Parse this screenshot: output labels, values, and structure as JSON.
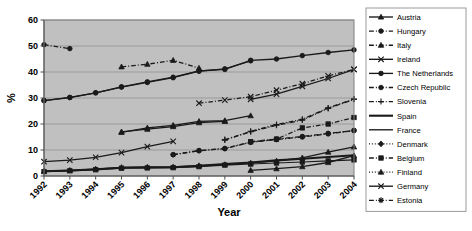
{
  "chart_data": {
    "type": "line",
    "title": "",
    "xlabel": "Year",
    "ylabel": "%",
    "x": [
      1992,
      1993,
      1994,
      1995,
      1996,
      1997,
      1998,
      1999,
      2000,
      2001,
      2002,
      2003,
      2004
    ],
    "xtick_labels": [
      "1992",
      "1993",
      "1994",
      "1995",
      "1996",
      "1997",
      "1998",
      "1999",
      "2000",
      "2001",
      "2002",
      "2003",
      "2004"
    ],
    "ytick_labels": [
      "0",
      "10",
      "20",
      "30",
      "40",
      "50",
      "60"
    ],
    "yticks": [
      0,
      10,
      20,
      30,
      40,
      50,
      60
    ],
    "ylim": [
      0,
      60
    ],
    "grid": "horizontal",
    "legend_position": "right",
    "plot_background": "#c0c0c0",
    "line_color": "#1a1a1a",
    "series": [
      {
        "name": "Austria",
        "marker": "triangle",
        "dash": "solid",
        "values": [
          null,
          null,
          null,
          null,
          null,
          null,
          null,
          null,
          2.2,
          2.8,
          3.6,
          5.2,
          7.8
        ]
      },
      {
        "name": "Hungary",
        "marker": "circle",
        "dash": "dashdot",
        "values": [
          50.5,
          49.0,
          null,
          null,
          null,
          null,
          null,
          null,
          null,
          null,
          null,
          null,
          null
        ]
      },
      {
        "name": "Italy",
        "marker": "triangle",
        "dash": "dashdot",
        "values": [
          null,
          null,
          null,
          42.0,
          43.0,
          44.5,
          41.5,
          null,
          null,
          null,
          null,
          null,
          null
        ]
      },
      {
        "name": "Ireland",
        "marker": "x",
        "dash": "solid",
        "values": [
          5.5,
          6.1,
          7.2,
          9.0,
          11.3,
          13.3,
          null,
          null,
          null,
          null,
          null,
          null,
          null
        ]
      },
      {
        "name": "The Netherlands",
        "marker": "circle",
        "dash": "solid",
        "values": [
          29.0,
          30.2,
          32.0,
          34.3,
          36.2,
          38.0,
          40.4,
          41.0,
          44.5,
          45.0,
          46.3,
          47.5,
          48.5
        ]
      },
      {
        "name": "Czech Republic",
        "marker": "circle",
        "dash": "dashdot",
        "values": [
          null,
          null,
          null,
          null,
          null,
          8.2,
          9.7,
          10.6,
          13.0,
          14.0,
          15.0,
          16.2,
          17.5
        ]
      },
      {
        "name": "Slovenia",
        "marker": "plus",
        "dash": "dashdot",
        "values": [
          null,
          null,
          null,
          null,
          null,
          null,
          null,
          14.0,
          17.0,
          19.5,
          21.5,
          26.0,
          29.5
        ]
      },
      {
        "name": "Spain",
        "marker": "none",
        "dash": "solid",
        "values": [
          1.8,
          2.1,
          2.6,
          3.2,
          3.3,
          3.4,
          3.9,
          4.6,
          5.2,
          6.0,
          6.6,
          7.3,
          8.0
        ]
      },
      {
        "name": "France",
        "marker": "none",
        "dash": "solid",
        "values": [
          null,
          null,
          null,
          null,
          null,
          null,
          null,
          null,
          null,
          null,
          null,
          null,
          null
        ]
      },
      {
        "name": "Denmark",
        "marker": "diamond",
        "dash": "dotted",
        "values": [
          null,
          null,
          null,
          null,
          null,
          null,
          null,
          null,
          null,
          null,
          null,
          null,
          null
        ]
      },
      {
        "name": "Belgium",
        "marker": "square",
        "dash": "dashdot",
        "values": [
          null,
          null,
          null,
          null,
          null,
          null,
          null,
          null,
          13.2,
          14.2,
          18.5,
          20.0,
          22.5
        ]
      },
      {
        "name": "Finland",
        "marker": "triangle",
        "dash": "dotted",
        "values": [
          null,
          null,
          null,
          null,
          null,
          null,
          null,
          null,
          null,
          null,
          null,
          null,
          null
        ]
      },
      {
        "name": "Germany",
        "marker": "x",
        "dash": "solid",
        "values": [
          null,
          null,
          null,
          null,
          null,
          null,
          null,
          null,
          29.5,
          31.5,
          34.5,
          37.5,
          41.0
        ]
      },
      {
        "name": "Estonia",
        "marker": "star",
        "dash": "dashdot",
        "values": [
          null,
          null,
          null,
          null,
          null,
          null,
          null,
          null,
          null,
          null,
          null,
          null,
          null
        ]
      }
    ],
    "extra_paths": [
      {
        "name": "Austria-early",
        "marker": "triangle",
        "dash": "solid",
        "values": [
          null,
          null,
          null,
          16.8,
          18.5,
          19.5,
          21.0,
          21.3,
          23.2,
          null,
          null,
          null,
          null
        ]
      },
      {
        "name": "Italy-late",
        "marker": "triangle",
        "dash": "solid",
        "values": [
          null,
          null,
          null,
          17.0,
          18.0,
          19.0,
          20.5,
          21.0,
          null,
          null,
          null,
          null,
          null
        ]
      },
      {
        "name": "Netherlands-alt",
        "marker": "circle",
        "dash": "solid",
        "values": [
          29.0,
          30.2,
          32.0,
          34.2,
          36.0,
          37.8,
          40.3,
          41.2,
          44.3,
          null,
          null,
          null,
          null
        ]
      },
      {
        "name": "Germany-early",
        "marker": "x",
        "dash": "dashdot",
        "values": [
          null,
          null,
          null,
          null,
          null,
          null,
          28.0,
          29.2,
          30.5,
          33.0,
          35.5,
          38.5,
          41.0
        ]
      },
      {
        "name": "Czech-line",
        "marker": "circle",
        "dash": "dashdot",
        "values": [
          null,
          null,
          null,
          null,
          null,
          8.2,
          9.8,
          10.5,
          13.0,
          14.2,
          15.2,
          16.4,
          17.5
        ]
      },
      {
        "name": "Slovenia-line",
        "marker": "plus",
        "dash": "dashdot",
        "values": [
          null,
          null,
          null,
          null,
          null,
          null,
          null,
          13.8,
          17.2,
          19.8,
          21.8,
          26.2,
          29.6
        ]
      },
      {
        "name": "Spain-low",
        "marker": "triangle",
        "dash": "solid",
        "values": [
          1.9,
          2.2,
          2.7,
          3.3,
          3.4,
          3.5,
          4.0,
          4.4,
          5.0,
          5.8,
          7.0,
          9.2,
          11.2
        ]
      },
      {
        "name": "Lowflat",
        "marker": "square",
        "dash": "solid",
        "values": [
          1.7,
          2.0,
          2.4,
          3.0,
          3.1,
          3.2,
          3.6,
          4.2,
          4.6,
          5.0,
          5.4,
          5.8,
          6.2
        ]
      }
    ]
  },
  "legend": {
    "items": [
      {
        "label": "Austria"
      },
      {
        "label": "Hungary"
      },
      {
        "label": "Italy"
      },
      {
        "label": "Ireland"
      },
      {
        "label": "The Netherlands"
      },
      {
        "label": "Czech Republic"
      },
      {
        "label": "Slovenia"
      },
      {
        "label": "Spain"
      },
      {
        "label": "France"
      },
      {
        "label": "Denmark"
      },
      {
        "label": "Belgium"
      },
      {
        "label": "Finland"
      },
      {
        "label": "Germany"
      },
      {
        "label": "Estonia"
      }
    ]
  }
}
